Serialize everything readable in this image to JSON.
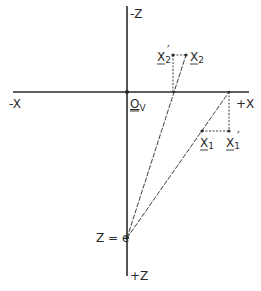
{
  "diagram": {
    "axes": {
      "neg_x_label": "-X",
      "pos_x_label": "+X",
      "neg_z_label": "-Z",
      "pos_z_label": "+Z",
      "origin_label": "O",
      "origin_subscript": "V"
    },
    "eye_point_label": "Z = e",
    "points": {
      "x1": {
        "label": "X",
        "subscript": "1",
        "prime": ""
      },
      "x1_prime": {
        "label": "X",
        "subscript": "1",
        "prime": "′"
      },
      "x2": {
        "label": "X",
        "subscript": "2",
        "prime": ""
      },
      "x2_prime": {
        "label": "X",
        "subscript": "2",
        "prime": "′"
      }
    },
    "colors": {
      "ink": "#2a2a2a",
      "background": "#ffffff"
    }
  }
}
